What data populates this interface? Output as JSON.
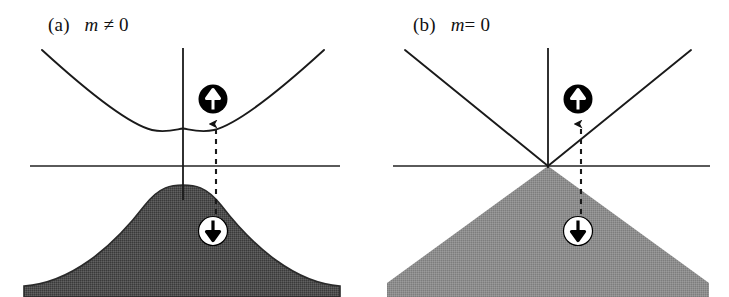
{
  "figure": {
    "type": "scientific-diagram",
    "background_color": "#ffffff",
    "line_color": "#1a1a1a",
    "panel_count": 2
  },
  "panels": [
    {
      "id": "a",
      "label_tag": "(a)",
      "label_symbol": "m",
      "label_relation": " ≠ 0",
      "label_full": "(a)   m ≠ 0",
      "band_type": "gapped-parabolic",
      "fill_color": "#555555",
      "has_energy_gap": true,
      "conduction_band": {
        "name": "conduction-band-curve",
        "shape": "parabola-with-gap",
        "minimum_x": 183,
        "minimum_y": 128
      },
      "valence_band": {
        "name": "valence-band-dome",
        "shape": "rounded-dome",
        "maximum_x": 183,
        "maximum_y": 185,
        "base_left_x": 24,
        "base_right_x": 340
      },
      "fermi_line": {
        "name": "fermi-level-line",
        "y": 166,
        "x_start": 30,
        "x_end": 340
      },
      "energy_axis": {
        "name": "energy-axis",
        "x": 183,
        "y_top": 48,
        "y_bottom": 200
      },
      "transition": {
        "name": "optical-transition-arrow",
        "style": "dashed-upward",
        "x": 216,
        "y_start": 232,
        "y_end": 122
      },
      "spin_up_marker": {
        "name": "spin-up-circle",
        "glyph": "↑",
        "circle_fill": "#000000",
        "arrow_color": "#ffffff",
        "cx": 213,
        "cy": 99,
        "r": 14
      },
      "spin_down_marker": {
        "name": "spin-down-circle",
        "glyph": "↓",
        "circle_fill": "#ffffff",
        "arrow_color": "#000000",
        "cx": 213,
        "cy": 231,
        "r": 14
      }
    },
    {
      "id": "b",
      "label_tag": "(b)",
      "label_symbol": "m",
      "label_relation": "= 0",
      "label_full": "(b)   m= 0",
      "band_type": "gapless-linear-dirac",
      "fill_color": "#8a8a8a",
      "has_energy_gap": false,
      "conduction_band": {
        "name": "conduction-band-cone",
        "shape": "linear-cone",
        "apex_x": 183,
        "apex_y": 166
      },
      "valence_band": {
        "name": "valence-band-triangle",
        "shape": "linear-cone-inverted",
        "apex_x": 183,
        "apex_y": 166,
        "base_left_x": 24,
        "base_right_x": 340
      },
      "fermi_line": {
        "name": "fermi-level-line",
        "y": 166,
        "x_start": 28,
        "x_end": 345
      },
      "energy_axis": {
        "name": "energy-axis",
        "x": 183,
        "y_top": 48,
        "y_bottom": 166
      },
      "transition": {
        "name": "optical-transition-arrow",
        "style": "dashed-upward",
        "x": 216,
        "y_start": 232,
        "y_end": 122
      },
      "spin_up_marker": {
        "name": "spin-up-circle",
        "glyph": "↑",
        "circle_fill": "#000000",
        "arrow_color": "#ffffff",
        "cx": 213,
        "cy": 99,
        "r": 14
      },
      "spin_down_marker": {
        "name": "spin-down-circle",
        "glyph": "↓",
        "circle_fill": "#ffffff",
        "arrow_color": "#000000",
        "cx": 213,
        "cy": 231,
        "r": 14
      }
    }
  ]
}
